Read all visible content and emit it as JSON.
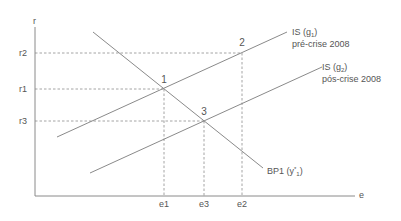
{
  "diagram": {
    "axes": {
      "y_label": "r",
      "x_label": "e"
    },
    "y_ticks": [
      "r2",
      "r1",
      "r3"
    ],
    "x_ticks": [
      "e1",
      "e3",
      "e2"
    ],
    "points": [
      "1",
      "2",
      "3"
    ],
    "curves": {
      "is1": {
        "name": "IS (g",
        "sub": "1",
        "close": ")",
        "note": "pré-crise 2008"
      },
      "is2": {
        "name": "IS (g",
        "sub": "2",
        "close": ")",
        "note": "pós-crise 2008"
      },
      "bp1": {
        "name": "BP1 (y",
        "sup": "*",
        "sub": "1",
        "close": ")"
      }
    },
    "colors": {
      "lines": "#8a8a8a",
      "text": "#555555"
    }
  }
}
